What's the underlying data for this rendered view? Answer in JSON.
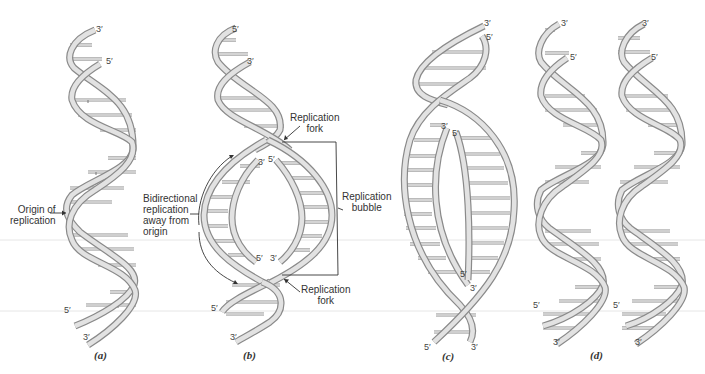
{
  "figure": {
    "panels": [
      {
        "id": "a",
        "caption": "(a)"
      },
      {
        "id": "b",
        "caption": "(b)"
      },
      {
        "id": "c",
        "caption": "(c)"
      },
      {
        "id": "d",
        "caption": "(d)"
      }
    ],
    "labels": {
      "origin_of_replication": [
        "Origin of",
        "replication"
      ],
      "replication_fork_top": [
        "Replication",
        "fork"
      ],
      "replication_fork_bottom": [
        "Replication",
        "fork"
      ],
      "replication_bubble": [
        "Replication",
        "bubble"
      ],
      "bidirectional": [
        "Bidirectional",
        "replication",
        "away from",
        "origin"
      ]
    },
    "strand_ends": {
      "three_prime": "3′",
      "five_prime": "5′"
    },
    "colors": {
      "strand_outline": "#8a8a8a",
      "strand_fill": "#e2e2e2",
      "text": "#333333"
    }
  }
}
